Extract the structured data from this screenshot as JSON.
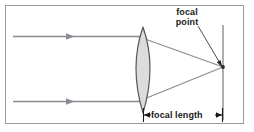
{
  "figure": {
    "background_color": "#ffffff",
    "border_color": "#9a9a9a",
    "labels": {
      "focal_point_line1": "focal",
      "focal_point_line2": "point",
      "focal_length": "focal length"
    },
    "colors": {
      "ray": "#8c8c96",
      "lens_outline": "#55555a",
      "lens_fill": "#dcdcdc",
      "screen_line": "#8c8c96",
      "annotation": "#1a1a1a"
    },
    "geometry": {
      "frame": {
        "x": 5,
        "y": 5,
        "width": 239,
        "height": 119
      },
      "lens": {
        "center_x": 143,
        "top_y": 27,
        "bottom_y": 113,
        "half_width": 13
      },
      "incoming_rays": [
        {
          "y": 36,
          "x_start": 13,
          "x_end": 143,
          "arrow_x": 72
        },
        {
          "y": 101,
          "x_start": 13,
          "x_end": 143,
          "arrow_x": 72
        }
      ],
      "focal_point": {
        "x": 223,
        "y": 67
      },
      "screen_line": {
        "x": 223,
        "y_top": 25,
        "y_bottom": 120
      },
      "focal_length_arrow": {
        "x_start": 143,
        "x_end": 223,
        "y": 115
      },
      "pointer_line": {
        "x1": 198,
        "y1": 26,
        "x2": 221,
        "y2": 64
      }
    }
  }
}
